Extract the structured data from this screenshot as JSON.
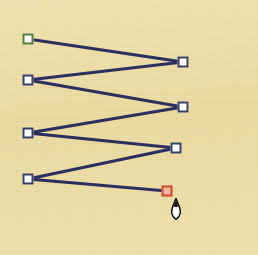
{
  "canvas": {
    "width": 258,
    "height": 255,
    "background_color": "#eadc9f",
    "edge_color": "#ffffff",
    "surface_name": "paper-texture"
  },
  "shape": {
    "name": "zigzag-polyline",
    "type": "polyline",
    "stroke_color": "#2a2f5e",
    "stroke_width": 3,
    "point_count": 8,
    "points": [
      {
        "index": 0,
        "x": 28,
        "y": 39,
        "role": "start",
        "handle_color": "#4f7d33",
        "label": "P1"
      },
      {
        "index": 1,
        "x": 183,
        "y": 62,
        "role": "normal",
        "handle_color": "#3b3f63",
        "label": "P2"
      },
      {
        "index": 2,
        "x": 28,
        "y": 80,
        "role": "normal",
        "handle_color": "#3b3f63",
        "label": "P3"
      },
      {
        "index": 3,
        "x": 183,
        "y": 107,
        "role": "normal",
        "handle_color": "#3b3f63",
        "label": "P4"
      },
      {
        "index": 4,
        "x": 28,
        "y": 133,
        "role": "normal",
        "handle_color": "#3b3f63",
        "label": "P5"
      },
      {
        "index": 5,
        "x": 176,
        "y": 148,
        "role": "normal",
        "handle_color": "#3b3f63",
        "label": "P6"
      },
      {
        "index": 6,
        "x": 28,
        "y": 179,
        "role": "normal",
        "handle_color": "#3b3f63",
        "label": "P7"
      },
      {
        "index": 7,
        "x": 167,
        "y": 191,
        "role": "end",
        "handle_color": "#d24a2c",
        "label": "P8"
      }
    ]
  },
  "cursor": {
    "name": "pen-nib-cursor",
    "x": 168,
    "y": 198,
    "fill_color": "#ffffff",
    "outline_color": "#000000"
  }
}
